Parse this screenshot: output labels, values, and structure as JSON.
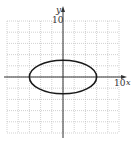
{
  "chart_data": {
    "type": "line",
    "title": "",
    "xlabel": "x",
    "ylabel": "y",
    "xlim": [
      -10,
      10
    ],
    "ylim": [
      -10,
      10
    ],
    "grid": true,
    "grid_step": 2,
    "tick_labels": {
      "x_max": "10",
      "y_max": "10"
    },
    "series": [
      {
        "name": "ellipse",
        "equation": "x^2/36 + y^2/9 = 1",
        "center": [
          0,
          0
        ],
        "semi_axis_x": 6,
        "semi_axis_y": 3,
        "color": "#1a1a1a"
      }
    ]
  },
  "colors": {
    "grid": "#bdbdbd",
    "axis": "#333333",
    "curve": "#1a1a1a"
  }
}
